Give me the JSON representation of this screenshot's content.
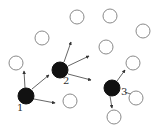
{
  "diagram": {
    "colors": {
      "background": "#ffffff",
      "hollow_stroke": "#8a8a8a",
      "filled": "#111111",
      "edge": "#555555"
    },
    "hub_nodes": [
      {
        "id": "1",
        "label": "1",
        "cx": 26,
        "cy": 96,
        "r": 8,
        "label_x": 17,
        "label_y": 111
      },
      {
        "id": "2",
        "label": "2",
        "cx": 60,
        "cy": 70,
        "r": 8,
        "label_x": 63,
        "label_y": 84
      },
      {
        "id": "3",
        "label": "3",
        "cx": 112,
        "cy": 88,
        "r": 8,
        "label_x": 121,
        "label_y": 95
      }
    ],
    "hollow_nodes": [
      {
        "cx": 42,
        "cy": 38,
        "r": 7
      },
      {
        "cx": 77,
        "cy": 17,
        "r": 7
      },
      {
        "cx": 110,
        "cy": 16,
        "r": 7
      },
      {
        "cx": 143,
        "cy": 31,
        "r": 7
      },
      {
        "cx": 106,
        "cy": 47,
        "r": 7
      },
      {
        "cx": 133,
        "cy": 63,
        "r": 7
      },
      {
        "cx": 16,
        "cy": 63,
        "r": 7
      },
      {
        "cx": 70,
        "cy": 101,
        "r": 7
      },
      {
        "cx": 136,
        "cy": 98,
        "r": 7
      },
      {
        "cx": 114,
        "cy": 117,
        "r": 7
      }
    ],
    "edges": [
      {
        "from": "1",
        "x1": 25,
        "y1": 88,
        "x2": 24,
        "y2": 71
      },
      {
        "from": "1",
        "x1": 32,
        "y1": 89,
        "x2": 49,
        "y2": 75
      },
      {
        "from": "1",
        "x1": 34,
        "y1": 99,
        "x2": 55,
        "y2": 103
      },
      {
        "from": "2",
        "x1": 64,
        "y1": 62,
        "x2": 71,
        "y2": 42
      },
      {
        "from": "2",
        "x1": 68,
        "y1": 66,
        "x2": 89,
        "y2": 56
      },
      {
        "from": "2",
        "x1": 68,
        "y1": 74,
        "x2": 91,
        "y2": 80
      },
      {
        "from": "3",
        "x1": 117,
        "y1": 81,
        "x2": 125,
        "y2": 70
      },
      {
        "from": "3",
        "x1": 125,
        "y1": 92,
        "x2": 133,
        "y2": 95
      },
      {
        "from": "3",
        "x1": 110,
        "y1": 96,
        "x2": 112,
        "y2": 108
      }
    ]
  }
}
